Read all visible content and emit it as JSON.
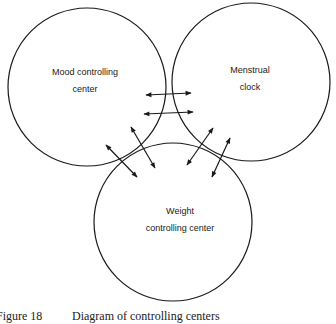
{
  "diagram": {
    "type": "venn-like circles",
    "nodes": [
      {
        "id": "mood",
        "label_line1": "Mood controlling",
        "label_line2": "center"
      },
      {
        "id": "menstrual",
        "label_line1": "Menstrual",
        "label_line2": "clock"
      },
      {
        "id": "weight",
        "label_line1": "Weight",
        "label_line2": "controlling center"
      }
    ],
    "edges": [
      {
        "from": "mood",
        "to": "menstrual",
        "style": "double-headed arrows",
        "count": 2
      },
      {
        "from": "mood",
        "to": "weight",
        "style": "double-headed arrows",
        "count": 2
      },
      {
        "from": "menstrual",
        "to": "weight",
        "style": "double-headed arrows",
        "count": 2
      }
    ]
  },
  "caption": {
    "figure": "Figure 18",
    "text": "Diagram of controlling centers"
  },
  "colors": {
    "line": "#1a1a1a",
    "background": "#ffffff"
  }
}
